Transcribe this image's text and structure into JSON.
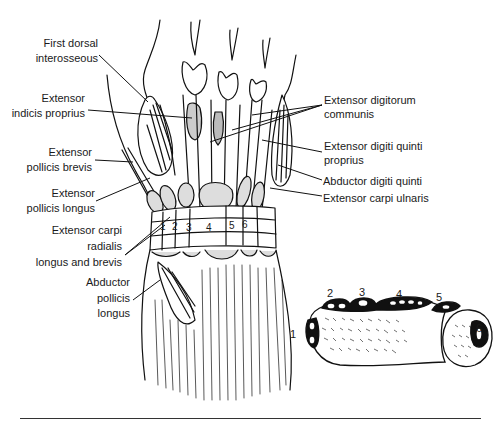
{
  "figure": {
    "left_labels": [
      {
        "id": "first-dorsal-interosseous",
        "lines": [
          "First dorsal",
          "interosseous"
        ]
      },
      {
        "id": "extensor-indicis-proprius",
        "lines": [
          "Extensor",
          "indicis proprius"
        ]
      },
      {
        "id": "extensor-pollicis-brevis",
        "lines": [
          "Extensor",
          "pollicis brevis"
        ]
      },
      {
        "id": "extensor-pollicis-longus",
        "lines": [
          "Extensor",
          "pollicis longus"
        ]
      },
      {
        "id": "extensor-carpi-radialis",
        "lines": [
          "Extensor carpi",
          "radialis",
          "longus and brevis"
        ]
      },
      {
        "id": "abductor-pollicis-longus",
        "lines": [
          "Abductor",
          "pollicis",
          "longus"
        ]
      }
    ],
    "right_labels": [
      {
        "id": "extensor-digitorum-communis",
        "lines": [
          "Extensor digitorum",
          "communis"
        ]
      },
      {
        "id": "extensor-digiti-quinti-proprius",
        "lines": [
          "Extensor digiti quinti",
          "proprius"
        ]
      },
      {
        "id": "abductor-digiti-quinti",
        "lines": [
          "Abductor digiti quinti"
        ]
      },
      {
        "id": "extensor-carpi-ulnaris",
        "lines": [
          "Extensor carpi ulnaris"
        ]
      }
    ],
    "retinaculum_compartments": [
      "1",
      "2",
      "3",
      "4",
      "5",
      "6"
    ],
    "cross_section_compartments": [
      "1",
      "2",
      "3",
      "4",
      "5",
      "6"
    ]
  }
}
